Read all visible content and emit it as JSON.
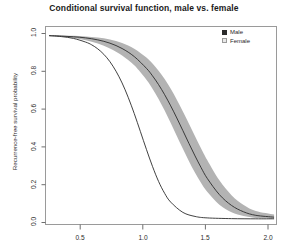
{
  "chart_data": {
    "type": "line",
    "title": "Conditional survival function, male vs. female",
    "xlabel": "",
    "ylabel": "Recurrence-free survival probability",
    "xlim": [
      0.17,
      2.07
    ],
    "ylim": [
      -0.03,
      1.05
    ],
    "grid": false,
    "legend_position": "top-right",
    "xticks": [
      0.5,
      1.0,
      1.5,
      2.0
    ],
    "xtick_labels": [
      "0.5",
      "1.0",
      "1.5",
      "2.0"
    ],
    "yticks": [
      0.0,
      0.2,
      0.4,
      0.6,
      0.8,
      1.0
    ],
    "ytick_labels": [
      "0.0",
      "0.2",
      "0.4",
      "0.6",
      "0.8",
      "1.0"
    ],
    "series": [
      {
        "name": "Male",
        "color": "#2b2b2b",
        "has_band": false,
        "x": [
          0.2,
          0.3,
          0.4,
          0.5,
          0.55,
          0.6,
          0.65,
          0.7,
          0.75,
          0.8,
          0.85,
          0.9,
          0.95,
          1.0,
          1.05,
          1.1,
          1.15,
          1.2,
          1.3,
          1.4,
          1.5,
          1.7,
          1.9,
          2.05
        ],
        "y": [
          1.0,
          0.995,
          0.985,
          0.965,
          0.95,
          0.928,
          0.898,
          0.858,
          0.806,
          0.742,
          0.664,
          0.575,
          0.478,
          0.38,
          0.287,
          0.205,
          0.14,
          0.092,
          0.036,
          0.014,
          0.006,
          0.002,
          0.001,
          0.001
        ]
      },
      {
        "name": "Female",
        "color": "#2b2b2b",
        "has_band": true,
        "band_color": "#b3b3b3",
        "x": [
          0.2,
          0.3,
          0.4,
          0.5,
          0.6,
          0.7,
          0.8,
          0.9,
          1.0,
          1.05,
          1.1,
          1.15,
          1.2,
          1.25,
          1.3,
          1.35,
          1.4,
          1.45,
          1.5,
          1.6,
          1.7,
          1.8,
          1.9,
          2.05
        ],
        "y": [
          1.0,
          0.998,
          0.994,
          0.988,
          0.977,
          0.959,
          0.93,
          0.886,
          0.822,
          0.781,
          0.733,
          0.678,
          0.617,
          0.551,
          0.482,
          0.412,
          0.344,
          0.28,
          0.222,
          0.133,
          0.074,
          0.039,
          0.02,
          0.01
        ],
        "y_upper": [
          1.0,
          1.0,
          0.999,
          0.996,
          0.99,
          0.979,
          0.96,
          0.929,
          0.881,
          0.848,
          0.809,
          0.763,
          0.71,
          0.651,
          0.587,
          0.52,
          0.452,
          0.385,
          0.322,
          0.211,
          0.13,
          0.076,
          0.043,
          0.024
        ],
        "y_lower": [
          1.0,
          0.995,
          0.987,
          0.975,
          0.957,
          0.93,
          0.892,
          0.838,
          0.76,
          0.711,
          0.655,
          0.592,
          0.524,
          0.453,
          0.383,
          0.315,
          0.252,
          0.196,
          0.148,
          0.078,
          0.037,
          0.016,
          0.006,
          0.002
        ]
      }
    ]
  },
  "legend": {
    "items": [
      {
        "label": "Male",
        "swatch": "filled-square",
        "color": "#2b2b2b"
      },
      {
        "label": "Female",
        "swatch": "open-square",
        "color": "#cfcfcf"
      }
    ]
  }
}
